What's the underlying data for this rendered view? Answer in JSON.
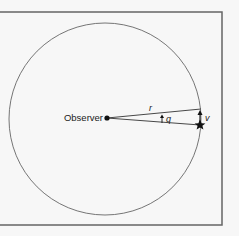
{
  "diagram": {
    "labels": {
      "observer": "Observer",
      "radius": "r",
      "angle": "q",
      "velocity": "v"
    },
    "colors": {
      "background": "#f7f7f7",
      "frame": "#666666",
      "stroke": "#555555",
      "ink": "#111111"
    },
    "elements": {
      "circle": {
        "cx": 105,
        "cy": 119,
        "r": 96
      },
      "observer_point": {
        "x": 107,
        "y": 118
      },
      "upper_ray_end": {
        "x": 201,
        "y": 109
      },
      "star_position": {
        "x": 200,
        "y": 125
      }
    }
  }
}
